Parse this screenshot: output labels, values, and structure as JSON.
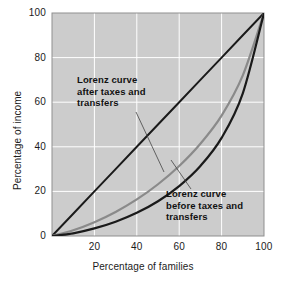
{
  "chart_data": {
    "type": "line",
    "title": "",
    "xlabel": "Percentage of families",
    "ylabel": "Percentage of income",
    "xlim": [
      0,
      100
    ],
    "ylim": [
      0,
      100
    ],
    "xticks": [
      "20",
      "40",
      "60",
      "80",
      "100"
    ],
    "xtick_values": [
      20,
      40,
      60,
      80,
      100
    ],
    "yticks": [
      "0",
      "20",
      "40",
      "60",
      "80",
      "100"
    ],
    "ytick_values": [
      0,
      20,
      40,
      60,
      80,
      100
    ],
    "grid": true,
    "grid_color": "#ffffff",
    "plot_background": "#cccccc",
    "legend": "none",
    "x": [
      0,
      10,
      20,
      30,
      40,
      50,
      60,
      70,
      80,
      90,
      100
    ],
    "series": [
      {
        "name": "Line of perfect equality",
        "color": "#1a1a1a",
        "style": "straight",
        "values": [
          0,
          10,
          20,
          30,
          40,
          50,
          60,
          70,
          80,
          90,
          100
        ]
      },
      {
        "name": "Lorenz curve after taxes and transfers",
        "color": "#8a8a8a",
        "style": "curve",
        "values": [
          0,
          2.6,
          6.2,
          10.8,
          16.4,
          23.2,
          31.4,
          41.4,
          54.0,
          72.0,
          100
        ]
      },
      {
        "name": "Lorenz curve before taxes and transfers",
        "color": "#1a1a1a",
        "style": "curve",
        "values": [
          0,
          1.2,
          3.4,
          6.4,
          10.4,
          15.6,
          22.4,
          31.4,
          44.0,
          64.0,
          100
        ]
      }
    ],
    "annotations": [
      {
        "id": "after",
        "lines": [
          "Lorenz curve",
          "after taxes and",
          "transfers"
        ],
        "target_point": [
          52,
          26
        ]
      },
      {
        "id": "before",
        "lines": [
          "Lorenz curve",
          "before taxes and",
          "transfers"
        ],
        "target_point": [
          65,
          24
        ]
      }
    ]
  },
  "axes": {
    "x_title": "Percentage of families",
    "y_title": "Percentage of income"
  },
  "ticks": {
    "y": [
      "100",
      "80",
      "60",
      "40",
      "20",
      "0"
    ],
    "x": [
      "20",
      "40",
      "60",
      "80",
      "100"
    ]
  },
  "annotations": {
    "after": {
      "line1": "Lorenz curve",
      "line2": "after taxes and",
      "line3": "transfers"
    },
    "before": {
      "line1": "Lorenz curve",
      "line2": "before taxes and",
      "line3": "transfers"
    }
  },
  "colors": {
    "plot_background": "#cccccc",
    "gridline": "#ffffff",
    "equality_line": "#1a1a1a",
    "after_curve": "#8a8a8a",
    "before_curve": "#1a1a1a",
    "plot_border": "#8f8f8f"
  }
}
